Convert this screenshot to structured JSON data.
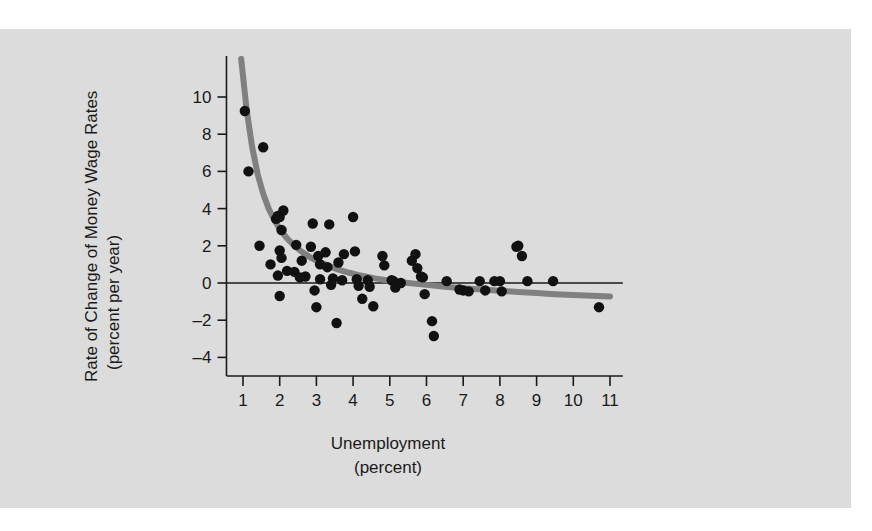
{
  "figure": {
    "panel_color": "#dcdcdc",
    "page_color": "#ffffff",
    "point_color": "#111111",
    "curve_color": "#808080",
    "axis_color": "#1a1a1a"
  },
  "yaxis": {
    "title_line1": "Rate of Change of Money Wage Rates",
    "title_line2": "(percent per year)",
    "ticks": [
      "10",
      "8",
      "6",
      "4",
      "2",
      "0",
      "–2",
      "–4"
    ]
  },
  "xaxis": {
    "title_line1": "Unemployment",
    "title_line2": "(percent)",
    "ticks": [
      "1",
      "2",
      "3",
      "4",
      "5",
      "6",
      "7",
      "8",
      "9",
      "10",
      "11"
    ]
  },
  "chart_data": {
    "type": "scatter",
    "title": "",
    "subtitle": "",
    "xlabel": "Unemployment (percent)",
    "ylabel": "Rate of Change of Money Wage Rates (percent per year)",
    "xlim": [
      0.3,
      11.6
    ],
    "ylim": [
      -5.0,
      12.2
    ],
    "xticks": [
      1,
      2,
      3,
      4,
      5,
      6,
      7,
      8,
      9,
      10,
      11
    ],
    "yticks": [
      -4,
      -2,
      0,
      2,
      4,
      6,
      8,
      10
    ],
    "grid": false,
    "legend": "none",
    "annotations": [
      {
        "name": "zero-line",
        "type": "hline",
        "y": 0,
        "x_from": 0.55,
        "x_to": 11.35
      }
    ],
    "series": [
      {
        "name": "Observations",
        "type": "scatter",
        "marker": "filled-circle",
        "color": "#111111",
        "points": [
          [
            1.05,
            9.25
          ],
          [
            1.15,
            6.0
          ],
          [
            1.55,
            7.3
          ],
          [
            1.45,
            2.0
          ],
          [
            1.9,
            3.45
          ],
          [
            1.95,
            3.6
          ],
          [
            2.0,
            3.55
          ],
          [
            2.1,
            3.9
          ],
          [
            2.05,
            2.85
          ],
          [
            2.0,
            1.75
          ],
          [
            2.05,
            1.35
          ],
          [
            1.75,
            1.0
          ],
          [
            2.2,
            0.65
          ],
          [
            1.95,
            0.4
          ],
          [
            2.0,
            -0.7
          ],
          [
            2.4,
            0.6
          ],
          [
            2.45,
            2.05
          ],
          [
            2.6,
            1.2
          ],
          [
            2.7,
            0.35
          ],
          [
            2.55,
            0.3
          ],
          [
            2.9,
            3.2
          ],
          [
            2.85,
            1.95
          ],
          [
            3.05,
            1.45
          ],
          [
            3.1,
            1.0
          ],
          [
            3.1,
            0.2
          ],
          [
            2.95,
            -0.4
          ],
          [
            3.0,
            -1.3
          ],
          [
            3.35,
            3.15
          ],
          [
            3.25,
            1.65
          ],
          [
            3.3,
            0.85
          ],
          [
            3.45,
            0.25
          ],
          [
            3.4,
            -0.1
          ],
          [
            3.6,
            1.1
          ],
          [
            3.7,
            0.15
          ],
          [
            3.75,
            1.55
          ],
          [
            3.55,
            -2.15
          ],
          [
            4.0,
            3.55
          ],
          [
            4.05,
            1.7
          ],
          [
            4.1,
            0.2
          ],
          [
            4.15,
            -0.15
          ],
          [
            4.25,
            -0.85
          ],
          [
            4.4,
            0.15
          ],
          [
            4.45,
            -0.2
          ],
          [
            4.55,
            -1.25
          ],
          [
            4.8,
            1.45
          ],
          [
            4.85,
            0.95
          ],
          [
            5.05,
            0.15
          ],
          [
            5.1,
            0.1
          ],
          [
            5.15,
            -0.25
          ],
          [
            5.3,
            0.0
          ],
          [
            5.6,
            1.2
          ],
          [
            5.7,
            1.55
          ],
          [
            5.75,
            0.8
          ],
          [
            5.85,
            0.35
          ],
          [
            5.9,
            0.3
          ],
          [
            5.95,
            -0.6
          ],
          [
            6.15,
            -2.05
          ],
          [
            6.2,
            -2.85
          ],
          [
            6.55,
            0.1
          ],
          [
            6.9,
            -0.35
          ],
          [
            7.0,
            -0.4
          ],
          [
            7.15,
            -0.45
          ],
          [
            7.45,
            0.1
          ],
          [
            7.6,
            -0.4
          ],
          [
            7.85,
            0.1
          ],
          [
            8.0,
            0.1
          ],
          [
            8.05,
            -0.45
          ],
          [
            8.45,
            1.95
          ],
          [
            8.5,
            2.0
          ],
          [
            8.6,
            1.45
          ],
          [
            8.75,
            0.1
          ],
          [
            9.45,
            0.1
          ],
          [
            10.7,
            -1.3
          ]
        ]
      },
      {
        "name": "Fitted Phillips Curve",
        "type": "line",
        "color": "#808080",
        "width": 6,
        "points": [
          [
            0.95,
            12.05
          ],
          [
            1.1,
            9.3
          ],
          [
            1.25,
            7.3
          ],
          [
            1.4,
            5.85
          ],
          [
            1.55,
            4.8
          ],
          [
            1.7,
            4.0
          ],
          [
            1.85,
            3.4
          ],
          [
            2.0,
            2.9
          ],
          [
            2.2,
            2.4
          ],
          [
            2.4,
            2.0
          ],
          [
            2.6,
            1.68
          ],
          [
            2.8,
            1.42
          ],
          [
            3.0,
            1.2
          ],
          [
            3.3,
            0.95
          ],
          [
            3.6,
            0.72
          ],
          [
            3.9,
            0.55
          ],
          [
            4.2,
            0.4
          ],
          [
            4.6,
            0.25
          ],
          [
            5.0,
            0.12
          ],
          [
            5.5,
            0.0
          ],
          [
            6.0,
            -0.1
          ],
          [
            6.5,
            -0.2
          ],
          [
            7.0,
            -0.28
          ],
          [
            7.5,
            -0.35
          ],
          [
            8.0,
            -0.42
          ],
          [
            8.5,
            -0.48
          ],
          [
            9.0,
            -0.54
          ],
          [
            9.5,
            -0.6
          ],
          [
            10.0,
            -0.64
          ],
          [
            10.5,
            -0.68
          ],
          [
            11.0,
            -0.72
          ]
        ]
      }
    ]
  }
}
